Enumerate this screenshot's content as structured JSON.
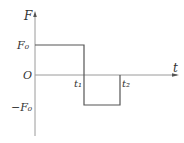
{
  "diagram": {
    "type": "force-time square wave",
    "axes": {
      "y_label": "F",
      "x_label": "t",
      "origin_label": "O"
    },
    "levels": {
      "positive": "F₀",
      "negative": "−F₀"
    },
    "time_marks": {
      "t1": "t₁",
      "t2": "t₂"
    },
    "segments": [
      {
        "from": "0",
        "to": "t₁",
        "value": "F₀"
      },
      {
        "from": "t₁",
        "to": "t₂",
        "value": "−F₀"
      }
    ],
    "colors": {
      "axis": "#999999",
      "curve": "#555555",
      "text": "#333333"
    }
  }
}
